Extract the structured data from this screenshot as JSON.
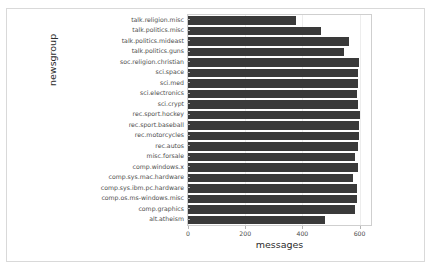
{
  "figure": {
    "background_color": "#ffffff",
    "frame_color": "#d9d9d9"
  },
  "chart_data": {
    "type": "bar",
    "orientation": "horizontal",
    "title": "",
    "xlabel": "messages",
    "ylabel": "newsgroup",
    "xlim": [
      0,
      640
    ],
    "ylim": null,
    "grid": true,
    "grid_axis": "x",
    "legend": null,
    "bar_color": "#3a3a3a",
    "xticks": [
      0,
      200,
      400,
      600
    ],
    "xtick_labels": [
      "0",
      "200",
      "400",
      "600"
    ],
    "categories": [
      "talk.religion.misc",
      "talk.politics.misc",
      "talk.politics.mideast",
      "talk.politics.guns",
      "soc.religion.christian",
      "sci.space",
      "sci.med",
      "sci.electronics",
      "sci.crypt",
      "rec.sport.hockey",
      "rec.sport.baseball",
      "rec.motorcycles",
      "rec.autos",
      "misc.forsale",
      "comp.windows.x",
      "comp.sys.mac.hardware",
      "comp.sys.ibm.pc.hardware",
      "comp.os.ms-windows.misc",
      "comp.graphics",
      "alt.atheism"
    ],
    "values": [
      377,
      465,
      564,
      546,
      599,
      593,
      594,
      591,
      595,
      600,
      597,
      598,
      594,
      585,
      593,
      578,
      590,
      591,
      584,
      480
    ]
  }
}
